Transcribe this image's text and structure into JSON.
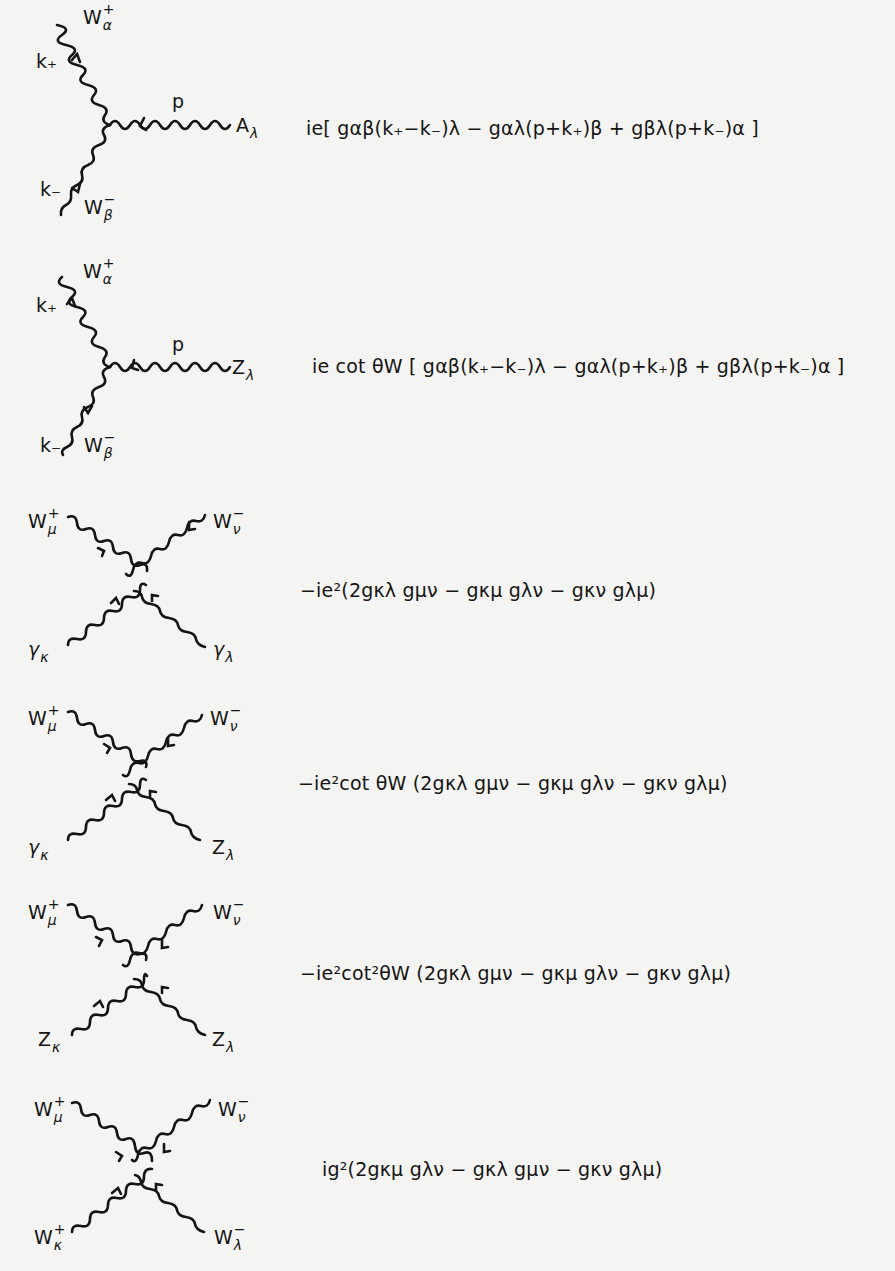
{
  "figure": {
    "vertices": [
      {
        "id": "WWA",
        "kind": "three-point",
        "labels": {
          "top": "W",
          "top_sup": "+",
          "top_sub": "α",
          "top_momentum": "k₊",
          "right": "A",
          "right_sub": "λ",
          "right_momentum": "p",
          "bottom": "W",
          "bottom_sup": "−",
          "bottom_sub": "β",
          "bottom_momentum": "k₋"
        },
        "rule": "ie[ g_{αβ}(k₊−k₋)_λ − g_{αλ}(p+k₊)_β + g_{βλ}(p+k₋)_α ]",
        "rule_display": "ie[ gαβ(k₊−k₋)λ − gαλ(p+k₊)β + gβλ(p+k₋)α ]"
      },
      {
        "id": "WWZ",
        "kind": "three-point",
        "labels": {
          "top": "W",
          "top_sup": "+",
          "top_sub": "α",
          "top_momentum": "k₊",
          "right": "Z",
          "right_sub": "λ",
          "right_momentum": "p",
          "bottom": "W",
          "bottom_sup": "−",
          "bottom_sub": "β",
          "bottom_momentum": "k₋"
        },
        "rule": "ie cot θ_W [ g_{αβ}(k₊−k₋)_λ − g_{αλ}(p+k₊)_β + g_{βλ}(p+k₋)_α ]",
        "rule_display": "ie cot θW [ gαβ(k₊−k₋)λ − gαλ(p+k₊)β + gβλ(p+k₋)α ]"
      },
      {
        "id": "WWAA",
        "kind": "four-point",
        "labels": {
          "top_left": "W",
          "top_left_sup": "+",
          "top_left_sub": "μ",
          "top_right": "W",
          "top_right_sup": "−",
          "top_right_sub": "ν",
          "bottom_left": "γ",
          "bottom_left_sub": "κ",
          "bottom_right": "γ",
          "bottom_right_sub": "λ"
        },
        "rule": "−ie²(2g_{κλ}g_{μν} − g_{κμ}g_{λν} − g_{κν}g_{λμ})",
        "rule_display": "−ie²(2gκλ gμν − gκμ gλν − gκν gλμ)"
      },
      {
        "id": "WWAZ",
        "kind": "four-point",
        "labels": {
          "top_left": "W",
          "top_left_sup": "+",
          "top_left_sub": "μ",
          "top_right": "W",
          "top_right_sup": "−",
          "top_right_sub": "ν",
          "bottom_left": "γ",
          "bottom_left_sub": "κ",
          "bottom_right": "Z",
          "bottom_right_sub": "λ"
        },
        "rule": "−ie²cot θ_W (2g_{κλ}g_{μν} − g_{κμ}g_{λν} − g_{κν}g_{λμ})",
        "rule_display": "−ie²cot θW (2gκλ gμν − gκμ gλν − gκν gλμ)"
      },
      {
        "id": "WWZZ",
        "kind": "four-point",
        "labels": {
          "top_left": "W",
          "top_left_sup": "+",
          "top_left_sub": "μ",
          "top_right": "W",
          "top_right_sup": "−",
          "top_right_sub": "ν",
          "bottom_left": "Z",
          "bottom_left_sub": "κ",
          "bottom_right": "Z",
          "bottom_right_sub": "λ"
        },
        "rule": "−ie²cot²θ_W (2g_{κλ}g_{μν} − g_{κμ}g_{λν} − g_{κν}g_{λμ})",
        "rule_display": "−ie²cot²θW (2gκλ gμν − gκμ gλν − gκν gλμ)"
      },
      {
        "id": "WWWW",
        "kind": "four-point",
        "labels": {
          "top_left": "W",
          "top_left_sup": "+",
          "top_left_sub": "μ",
          "top_right": "W",
          "top_right_sup": "−",
          "top_right_sub": "ν",
          "bottom_left": "W",
          "bottom_left_sup": "+",
          "bottom_left_sub": "κ",
          "bottom_right": "W",
          "bottom_right_sup": "−",
          "bottom_right_sub": "λ"
        },
        "rule": "ig²(2g_{κμ}g_{λν} − g_{κλ}g_{μν} − g_{κν}g_{λμ})",
        "rule_display": "ig²(2gκμ gλν − gκλ gμν − gκν gλμ)"
      }
    ],
    "colors": {
      "background": "#f4f4f2",
      "ink": "#141414"
    }
  }
}
